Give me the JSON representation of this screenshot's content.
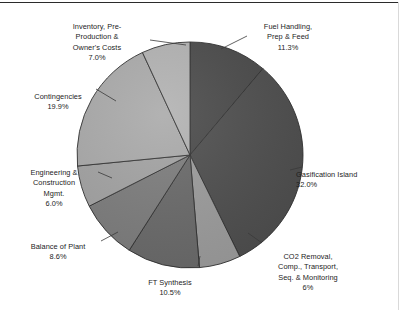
{
  "chart_data": {
    "type": "pie",
    "title": "",
    "subtitle": "",
    "legend_position": "labels-outside-with-leader-lines",
    "grid": false,
    "start_angle_deg": 0,
    "direction": "clockwise",
    "total_percent": 101.3,
    "categories": [
      "Fuel Handling, Prep & Feed",
      "Gasification Island",
      "CO2 Removal, Comp., Transport, Seq. & Monitoring",
      "FT Synthesis",
      "Balance of Plant",
      "Engineering & Construction Mgmt.",
      "Contingencies",
      "Inventory, Pre-Production & Owner's Costs"
    ],
    "values": [
      11.3,
      32.0,
      6.0,
      10.5,
      8.6,
      6.0,
      19.9,
      7.0
    ],
    "value_labels": [
      "11.3%",
      "32.0%",
      "6%",
      "10.5%",
      "8.6%",
      "6.0%",
      "19.9%",
      "7.0%"
    ],
    "colors": [
      "#4a4a4a",
      "#4e4e4e",
      "#9c9c9c",
      "#6a6a6a",
      "#7d7d7d",
      "#a3a3a3",
      "#aaaaaa",
      "#b2b2b2"
    ],
    "slice_border_color": "#2f2f2f",
    "xlabel": "",
    "ylabel": ""
  },
  "slices": [
    {
      "name": "fuel-handling",
      "label_line1": "Fuel Handling,",
      "label_line2": "Prep & Feed",
      "percent_label": "11.3%"
    },
    {
      "name": "gasification-island",
      "label_line1": "Gasification Island",
      "label_line2": "",
      "percent_label": "32.0%"
    },
    {
      "name": "co2-removal",
      "label_line1": "CO2 Removal,",
      "label_line2": "Comp., Transport,",
      "label_line3": "Seq. & Monitoring",
      "percent_label": "6%"
    },
    {
      "name": "ft-synthesis",
      "label_line1": "FT Synthesis",
      "label_line2": "",
      "percent_label": "10.5%"
    },
    {
      "name": "balance-of-plant",
      "label_line1": "Balance of Plant",
      "label_line2": "",
      "percent_label": "8.6%"
    },
    {
      "name": "engineering-construction",
      "label_line1": "Engineering &",
      "label_line2": "Construction",
      "label_line3": "Mgmt.",
      "percent_label": "6.0%"
    },
    {
      "name": "contingencies",
      "label_line1": "Contingencies",
      "label_line2": "",
      "percent_label": "19.9%"
    },
    {
      "name": "inventory-preproduction",
      "label_line1": "Inventory, Pre-",
      "label_line2": "Production &",
      "label_line3": "Owner's Costs",
      "percent_label": "7.0%"
    }
  ],
  "labels": {
    "fuel": "Fuel Handling,\nPrep & Feed",
    "fuel_pct": "11.3%",
    "gasification": "Gasification Island",
    "gasification_pct": "32.0%",
    "co2": "CO2 Removal,\nComp., Transport,\nSeq. & Monitoring",
    "co2_pct": "6%",
    "ft": "FT Synthesis",
    "ft_pct": "10.5%",
    "balance": "Balance of Plant",
    "balance_pct": "8.6%",
    "engineering": "Engineering &\nConstruction\nMgmt.",
    "engineering_pct": "6.0%",
    "contingencies": "Contingencies",
    "contingencies_pct": "19.9%",
    "inventory": "Inventory, Pre-\nProduction &\nOwner's Costs",
    "inventory_pct": "7.0%"
  }
}
